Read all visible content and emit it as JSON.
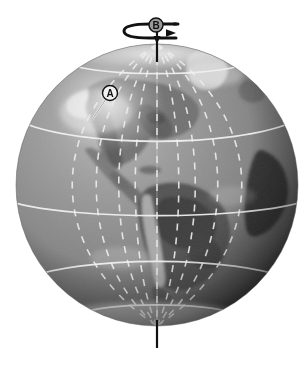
{
  "figure": {
    "background_color": "#ffffff",
    "type": "labeled-diagram",
    "image_style": "grayscale satellite globe"
  },
  "globe": {
    "center_x": 157,
    "center_y": 185,
    "radius": 141,
    "ocean_color": "#8a8a8a",
    "land_color": "#6e6e6e",
    "highlight_color": "#d8d8d8",
    "shadow_color": "#2e2e2e",
    "grid_line_color": "#e8e8e8",
    "solid_latitudes_y": [
      64,
      123,
      203,
      277,
      315
    ],
    "latitude_names": [
      "Arctic Circle",
      "Tropic of Cancer",
      "Equator",
      "Tropic of Capricorn",
      "Antarctic Circle"
    ],
    "dashed_meridian_count": 9
  },
  "axis": {
    "label": "rotation axis",
    "color": "#111111",
    "top_y": 18,
    "bottom_y": 348,
    "x": 157
  },
  "rotation_arrow": {
    "label": "rotation direction arrow",
    "color": "#111111",
    "direction": "eastward",
    "y": 30
  },
  "labels": [
    {
      "id": "A",
      "text": "A",
      "badge_x": 110,
      "badge_y": 93,
      "leader_to_x": 92,
      "leader_to_y": 118,
      "badge_fill": "#f2f2f2",
      "badge_stroke": "#111111"
    },
    {
      "id": "B",
      "text": "B",
      "badge_x": 156,
      "badge_y": 25,
      "leader_to_x": 156,
      "leader_to_y": 33,
      "badge_fill": "#9a9a9a",
      "badge_stroke": "#111111"
    }
  ]
}
